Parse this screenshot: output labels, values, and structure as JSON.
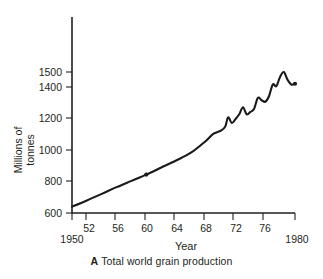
{
  "caption": {
    "letter": "A",
    "text": "Total world grain production"
  },
  "chart_data": {
    "type": "line",
    "title": "",
    "xlabel": "Year",
    "ylabel": "Millions of tonnes",
    "ylabel_line1": "Millions of",
    "ylabel_line2": "tonnes",
    "xlim": [
      1950,
      1980
    ],
    "ylim": [
      600,
      1560
    ],
    "grid": false,
    "legend": null,
    "line_color": "#1a1a1a",
    "background": "#ffffff",
    "xticks": [
      1950,
      1952,
      1956,
      1960,
      1964,
      1968,
      1972,
      1976,
      1980
    ],
    "xtick_labels": [
      "1950",
      "52",
      "56",
      "60",
      "64",
      "68",
      "72",
      "76",
      "1980"
    ],
    "yticks": [
      600,
      800,
      1000,
      1200,
      1400,
      1500
    ],
    "ytick_labels": [
      "600",
      "800",
      "1000",
      "1200",
      "1400",
      "1500"
    ],
    "series": [
      {
        "name": "Total world grain production",
        "x": [
          1950,
          1952,
          1954,
          1956,
          1958,
          1960,
          1962,
          1964,
          1966,
          1968,
          1969,
          1970,
          1970.6,
          1971,
          1971.5,
          1972,
          1972.5,
          1973,
          1973.5,
          1974,
          1974.5,
          1975,
          1975.5,
          1976,
          1976.5,
          1977,
          1977.5,
          1978,
          1978.5,
          1979,
          1979.5,
          1980
        ],
        "y": [
          640,
          680,
          722,
          765,
          805,
          845,
          890,
          935,
          985,
          1060,
          1105,
          1125,
          1150,
          1210,
          1175,
          1200,
          1230,
          1275,
          1230,
          1245,
          1265,
          1335,
          1320,
          1310,
          1345,
          1420,
          1410,
          1470,
          1500,
          1450,
          1420,
          1425
        ]
      }
    ],
    "markers": [
      {
        "x": 1960,
        "y": 845
      },
      {
        "x": 1980,
        "y": 1425
      }
    ],
    "annotations": []
  }
}
